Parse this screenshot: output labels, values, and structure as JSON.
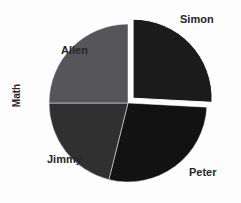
{
  "chart_data": {
    "type": "pie",
    "title": "",
    "series_title": "Math",
    "categories": [
      "Simon",
      "Peter",
      "Jimmy",
      "Allen"
    ],
    "values": [
      26,
      28,
      24,
      22
    ],
    "unit": "percent",
    "legend": "none",
    "labels_position": "outside",
    "exploded_slice": "Simon",
    "colors": [
      "#1b1b1b",
      "#121212",
      "#303030",
      "#55555a"
    ],
    "background": "#fdfdfd",
    "label_color": "#262626",
    "slices": [
      {
        "label": "Simon",
        "value": 26,
        "color": "#1b1b1b",
        "start_angle": 0,
        "end_angle": 93,
        "exploded": true
      },
      {
        "label": "Peter",
        "value": 28,
        "color": "#121212",
        "start_angle": 93,
        "end_angle": 194,
        "exploded": false
      },
      {
        "label": "Jimmy",
        "value": 24,
        "color": "#303030",
        "start_angle": 194,
        "end_angle": 270,
        "exploded": false
      },
      {
        "label": "Allen",
        "value": 22,
        "color": "#55555a",
        "start_angle": 270,
        "end_angle": 360,
        "exploded": false
      }
    ],
    "geometry": {
      "center_x": 128,
      "center_y": 103,
      "radius": 79,
      "explode_offset": 7
    }
  },
  "labels": {
    "simon": "Simon",
    "peter": "Peter",
    "jimmy": "Jimmy",
    "allen": "Allen",
    "math": "Math"
  }
}
